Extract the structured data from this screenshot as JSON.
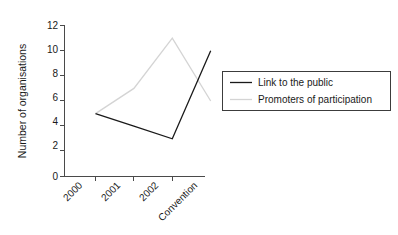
{
  "chart_data": {
    "type": "line",
    "title": "",
    "xlabel": "",
    "ylabel": "Number of organisations",
    "categories": [
      "2000",
      "2001",
      "2002",
      "Convention"
    ],
    "ylim": [
      0,
      12
    ],
    "yticks": [
      0,
      2,
      4,
      6,
      8,
      10,
      12
    ],
    "ytick_labels": [
      "0",
      "2",
      "4",
      "6",
      "8",
      "10",
      "12"
    ],
    "grid": false,
    "legend_position": "right",
    "xtick_rotation": 45,
    "series": [
      {
        "name": "Link to the public",
        "values": [
          5,
          4,
          3,
          10
        ],
        "color": "#1a1a1a"
      },
      {
        "name": "Promoters of participation",
        "values": [
          5,
          7,
          11,
          6
        ],
        "color": "#d4d4d4"
      }
    ]
  },
  "legend": {
    "items": [
      {
        "label": "Link to the public",
        "color": "#1a1a1a"
      },
      {
        "label": "Promoters of participation",
        "color": "#d4d4d4"
      }
    ]
  },
  "axes": {
    "y_title": "Number of organisations",
    "y_ticks": [
      "12",
      "10",
      "8",
      "6",
      "4",
      "2",
      "0"
    ],
    "x_ticks": [
      "2000",
      "2001",
      "2002",
      "Convention"
    ]
  }
}
